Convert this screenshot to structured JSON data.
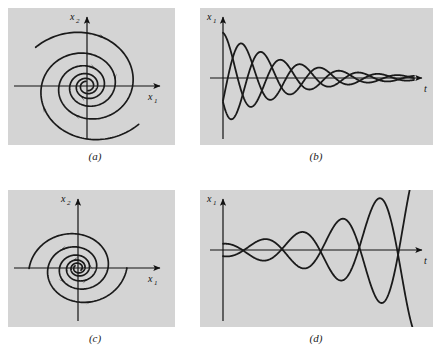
{
  "figure": {
    "background": "#ffffff",
    "panel_background": "#d4d4d4",
    "curve_color": "#1a1a1a",
    "axis_color": "#111111"
  },
  "panels": [
    {
      "id": "a",
      "caption": "(a)",
      "type": "phase-portrait",
      "description": "stable spiral sink: trajectories spiral inward toward the origin",
      "xlabel": "x",
      "xlabel_sub": "1",
      "ylabel": "x",
      "ylabel_sub": "2",
      "direction": "inward",
      "turns": 2.6
    },
    {
      "id": "b",
      "caption": "(b)",
      "type": "time-series",
      "description": "damped oscillations decaying toward zero",
      "xlabel": "t",
      "ylabel": "x",
      "ylabel_sub": "1",
      "envelope": "decaying",
      "n_curves": 3
    },
    {
      "id": "c",
      "caption": "(c)",
      "type": "phase-portrait",
      "description": "unstable spiral source: trajectories spiral outward from the origin",
      "xlabel": "x",
      "xlabel_sub": "1",
      "ylabel": "x",
      "ylabel_sub": "2",
      "direction": "outward",
      "turns": 2.6
    },
    {
      "id": "d",
      "caption": "(d)",
      "type": "time-series",
      "description": "growing oscillations increasing in amplitude",
      "xlabel": "t",
      "ylabel": "x",
      "ylabel_sub": "1",
      "envelope": "growing",
      "n_curves": 2
    }
  ],
  "chart_data": [
    {
      "type": "line",
      "panel": "a",
      "title": "",
      "xlabel": "x1",
      "ylabel": "x2",
      "xlim": [
        -1.15,
        1.15
      ],
      "ylim": [
        -1.0,
        1.0
      ],
      "grid": false,
      "legend": null,
      "series": [
        {
          "name": "spiral-1",
          "parametric": "r = 0.98 * exp(-0.155*theta), theta in [0, 16.4]",
          "r0": 0.98,
          "decay": 0.155,
          "theta_start": 0.0,
          "theta_end": 16.4,
          "theta0": 2.45,
          "sense": "clockwise-inward",
          "arrows_at_theta": [
            1.2,
            4.4,
            7.6,
            10.9
          ]
        },
        {
          "name": "spiral-2",
          "parametric": "r = 0.98 * exp(-0.155*theta), theta in [0, 16.4]",
          "r0": 0.98,
          "decay": 0.155,
          "theta_start": 0.0,
          "theta_end": 16.4,
          "theta0": 5.6,
          "sense": "clockwise-inward",
          "arrows_at_theta": [
            2.0,
            5.4
          ]
        }
      ]
    },
    {
      "type": "line",
      "panel": "b",
      "title": "",
      "xlabel": "t",
      "ylabel": "x1",
      "xlim": [
        0,
        10
      ],
      "ylim": [
        -1.0,
        1.0
      ],
      "grid": false,
      "legend": null,
      "series": [
        {
          "name": "curve-1",
          "form": "A*exp(-0.30*t)*cos(2.05*t + phi)",
          "amplitude": 0.78,
          "decay": 0.3,
          "omega": 2.05,
          "phase": 0.0
        },
        {
          "name": "curve-2",
          "form": "A*exp(-0.30*t)*cos(2.05*t + phi)",
          "amplitude": 0.82,
          "decay": 0.3,
          "omega": 2.05,
          "phase": 2.1
        },
        {
          "name": "curve-3",
          "form": "A*exp(-0.30*t)*cos(2.05*t + phi)",
          "amplitude": 0.8,
          "decay": 0.3,
          "omega": 2.05,
          "phase": 4.2
        }
      ]
    },
    {
      "type": "line",
      "panel": "c",
      "title": "",
      "xlabel": "x1",
      "ylabel": "x2",
      "xlim": [
        -1.15,
        1.15
      ],
      "ylim": [
        -1.0,
        1.0
      ],
      "grid": false,
      "legend": null,
      "series": [
        {
          "name": "spiral-1",
          "parametric": "r = 0.055 * exp(0.155*theta), theta in [0, 16.4]",
          "r0": 0.055,
          "growth": 0.155,
          "theta_start": 0.0,
          "theta_end": 16.4,
          "theta0": 2.45,
          "sense": "counterclockwise-outward",
          "arrows_at_theta": [
            6.0,
            9.2,
            12.4,
            15.2
          ]
        },
        {
          "name": "spiral-2",
          "parametric": "r = 0.055 * exp(0.155*theta), theta in [0, 16.4]",
          "r0": 0.055,
          "growth": 0.155,
          "theta_start": 0.0,
          "theta_end": 16.4,
          "theta0": 5.6,
          "sense": "counterclockwise-outward",
          "arrows_at_theta": [
            7.4,
            11.0
          ]
        }
      ]
    },
    {
      "type": "line",
      "panel": "d",
      "title": "",
      "xlabel": "t",
      "ylabel": "x1",
      "xlim": [
        0,
        10
      ],
      "ylim": [
        -1.0,
        1.0
      ],
      "grid": false,
      "legend": null,
      "series": [
        {
          "name": "curve-1",
          "form": "A*exp(0.26*t)*cos(1.55*t + phi)",
          "amplitude": 0.1,
          "growth": 0.26,
          "omega": 1.55,
          "phase": 0.0
        },
        {
          "name": "curve-2",
          "form": "A*exp(0.26*t)*cos(1.55*t + phi)",
          "amplitude": 0.1,
          "growth": 0.26,
          "omega": 1.55,
          "phase": 3.0
        }
      ]
    }
  ]
}
